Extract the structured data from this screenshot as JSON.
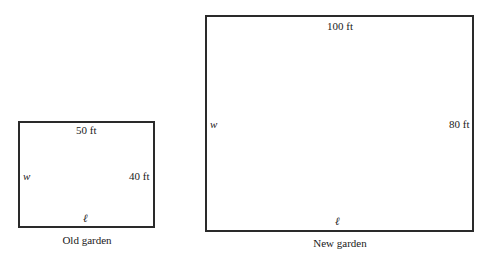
{
  "old_garden": {
    "caption": "Old garden",
    "top_label": "50 ft",
    "right_label": "40 ft",
    "left_label": "w",
    "bottom_label": "ℓ"
  },
  "new_garden": {
    "caption": "New garden",
    "top_label": "100 ft",
    "right_label": "80 ft",
    "left_label": "w",
    "bottom_label": "ℓ"
  }
}
